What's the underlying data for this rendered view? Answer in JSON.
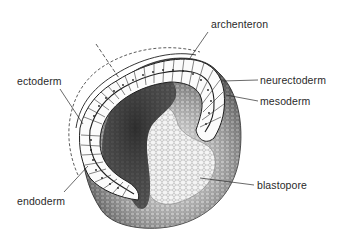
{
  "diagram": {
    "labels": [
      {
        "id": "archenteron",
        "text": "archenteron"
      },
      {
        "id": "ectoderm",
        "text": "ectoderm"
      },
      {
        "id": "neurectoderm",
        "text": "neurectoderm"
      },
      {
        "id": "mesoderm",
        "text": "mesoderm"
      },
      {
        "id": "blastopore",
        "text": "blastopore"
      },
      {
        "id": "endoderm",
        "text": "endoderm"
      }
    ],
    "colors": {
      "background": "#ffffff",
      "ink": "#2a2a2a",
      "shade_dark": "#3a3a3a",
      "shade_mid": "#8a8a8a",
      "shade_light": "#d8d8d8"
    }
  }
}
